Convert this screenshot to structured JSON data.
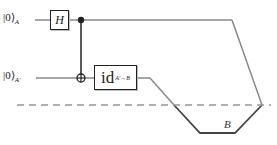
{
  "diagram": {
    "inputs": [
      {
        "ket": "|0⟩",
        "subscript": "A"
      },
      {
        "ket": "|0⟩",
        "subscript": "A'"
      }
    ],
    "gates": {
      "hadamard": "H",
      "identity": {
        "label": "id",
        "subscript": "A'→B"
      }
    },
    "channel_label": "B",
    "colors": {
      "wire": "#888888",
      "wire_dark": "#444444",
      "gate_border": "#222222",
      "dashed": "#999999"
    }
  }
}
